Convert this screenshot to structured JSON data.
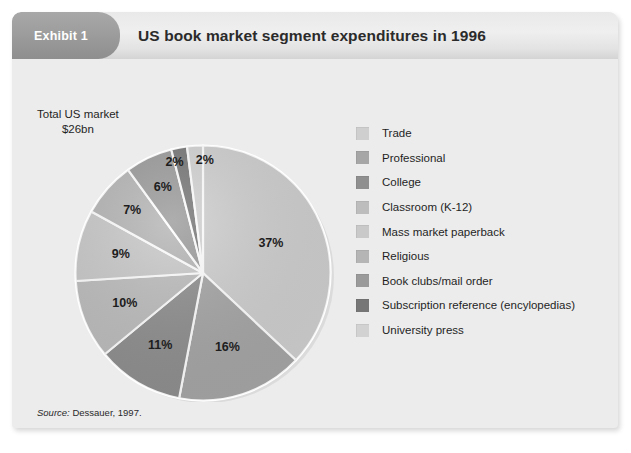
{
  "exhibit": {
    "badge_label": "Exhibit 1",
    "title": "US book market segment expenditures in 1996"
  },
  "annotations": {
    "total_line1": "Total US market",
    "total_line2": "$26bn"
  },
  "source": {
    "prefix": "Source:",
    "text": " Dessauer, 1997."
  },
  "colors": {
    "panel_bg": "#ececec",
    "badge": "#9d9d9d",
    "title_text": "#2b2b2b",
    "slice_separator": "#ffffff"
  },
  "chart_data": {
    "type": "pie",
    "title": "US book market segment expenditures in 1996",
    "subtitle": "Total US market $26bn",
    "unit": "percent",
    "total": "$26bn",
    "legend_position": "right",
    "grid": false,
    "start_angle_deg": 0,
    "direction": "clockwise",
    "categories": [
      "Trade",
      "Professional",
      "College",
      "Classroom (K-12)",
      "Mass market paperback",
      "Religious",
      "Book clubs/mail order",
      "Subscription reference (encylopedias)",
      "University press"
    ],
    "values": [
      37,
      16,
      11,
      10,
      9,
      7,
      6,
      2,
      2
    ],
    "labels": [
      "37%",
      "16%",
      "11%",
      "10%",
      "9%",
      "7%",
      "6%",
      "2%",
      "2%"
    ],
    "slice_colors": [
      "#cfcfcf",
      "#a6a6a6",
      "#8f8f8f",
      "#bdbdbd",
      "#c9c9c9",
      "#b5b5b5",
      "#9a9a9a",
      "#767676",
      "#d2d2d2"
    ],
    "slices": [
      {
        "label": "Trade",
        "value": 37,
        "display": "37%",
        "color": "#cfcfcf"
      },
      {
        "label": "Professional",
        "value": 16,
        "display": "16%",
        "color": "#a6a6a6"
      },
      {
        "label": "College",
        "value": 11,
        "display": "11%",
        "color": "#8f8f8f"
      },
      {
        "label": "Classroom (K-12)",
        "value": 10,
        "display": "10%",
        "color": "#bdbdbd"
      },
      {
        "label": "Mass market paperback",
        "value": 9,
        "display": "9%",
        "color": "#c9c9c9"
      },
      {
        "label": "Religious",
        "value": 7,
        "display": "7%",
        "color": "#b5b5b5"
      },
      {
        "label": "Book clubs/mail order",
        "value": 6,
        "display": "6%",
        "color": "#9a9a9a"
      },
      {
        "label": "Subscription reference (encylopedias)",
        "value": 2,
        "display": "2%",
        "color": "#767676"
      },
      {
        "label": "University press",
        "value": 2,
        "display": "2%",
        "color": "#d2d2d2"
      }
    ]
  },
  "legend": {
    "items": [
      {
        "label": "Trade",
        "color": "#cfcfcf"
      },
      {
        "label": "Professional",
        "color": "#a6a6a6"
      },
      {
        "label": "College",
        "color": "#8f8f8f"
      },
      {
        "label": "Classroom (K-12)",
        "color": "#bdbdbd"
      },
      {
        "label": "Mass market paperback",
        "color": "#c9c9c9"
      },
      {
        "label": "Religious",
        "color": "#b5b5b5"
      },
      {
        "label": "Book clubs/mail order",
        "color": "#9a9a9a"
      },
      {
        "label": "Subscription reference (encylopedias)",
        "color": "#767676"
      },
      {
        "label": "University press",
        "color": "#d2d2d2"
      }
    ]
  }
}
